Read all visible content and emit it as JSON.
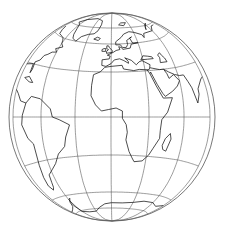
{
  "map": {
    "title": "Globe",
    "projection": "globular / orthographic-style hemisphere",
    "center": {
      "lon": 0,
      "lat": 0
    },
    "colors": {
      "background": "#ffffff",
      "graticule": "#5a5a5a",
      "coastline": "#111111",
      "rim": "#555555"
    },
    "canvas": {
      "width": 225,
      "height": 234
    },
    "globe": {
      "cx": 112,
      "cy": 117,
      "rx": 103,
      "ry": 104
    },
    "graticule": {
      "meridians": [
        -90,
        -60,
        -30,
        0,
        30,
        60,
        90
      ],
      "parallels": [
        -75,
        -60,
        -30,
        0,
        30,
        60,
        75
      ]
    },
    "parallel_center_y": {
      "-90": 221,
      "-75": 208,
      "-60": 192,
      "-30": 155,
      "0": 117,
      "30": 72,
      "60": 44,
      "75": 28,
      "90": 13
    },
    "parallel_edge_y": {
      "-90": 221,
      "-75": 214,
      "-60": 200,
      "-30": 166,
      "0": 117,
      "30": 62,
      "60": 32,
      "75": 22,
      "90": 13
    },
    "meridian_equator_x": {
      "-90": 13,
      "-60": 41,
      "-30": 75,
      "0": 111,
      "30": 149,
      "60": 184,
      "90": 210
    },
    "coastlines": [
      {
        "name": "Africa",
        "points": [
          [
            -17,
            21
          ],
          [
            -16,
            28
          ],
          [
            -10,
            30
          ],
          [
            -6,
            35
          ],
          [
            0,
            36
          ],
          [
            10,
            37
          ],
          [
            11,
            33
          ],
          [
            20,
            31
          ],
          [
            25,
            32
          ],
          [
            32,
            31
          ],
          [
            34,
            28
          ],
          [
            38,
            20
          ],
          [
            43,
            12
          ],
          [
            51,
            12
          ],
          [
            46,
            3
          ],
          [
            41,
            -2
          ],
          [
            40,
            -10
          ],
          [
            40,
            -16
          ],
          [
            35,
            -24
          ],
          [
            32,
            -29
          ],
          [
            27,
            -34
          ],
          [
            20,
            -35
          ],
          [
            18,
            -32
          ],
          [
            15,
            -27
          ],
          [
            12,
            -18
          ],
          [
            13,
            -12
          ],
          [
            12,
            -6
          ],
          [
            9,
            -1
          ],
          [
            9,
            4
          ],
          [
            4,
            6
          ],
          [
            -2,
            5
          ],
          [
            -8,
            4
          ],
          [
            -13,
            8
          ],
          [
            -17,
            14
          ],
          [
            -17,
            21
          ]
        ]
      },
      {
        "name": "Madagascar",
        "points": [
          [
            44,
            -24
          ],
          [
            47,
            -25
          ],
          [
            50,
            -16
          ],
          [
            49,
            -12
          ],
          [
            45,
            -16
          ],
          [
            43,
            -21
          ],
          [
            44,
            -24
          ]
        ]
      },
      {
        "name": "South America",
        "points": [
          [
            -77,
            8
          ],
          [
            -72,
            12
          ],
          [
            -62,
            11
          ],
          [
            -52,
            5
          ],
          [
            -50,
            0
          ],
          [
            -44,
            -2
          ],
          [
            -35,
            -6
          ],
          [
            -39,
            -15
          ],
          [
            -41,
            -22
          ],
          [
            -48,
            -27
          ],
          [
            -53,
            -34
          ],
          [
            -58,
            -38
          ],
          [
            -65,
            -42
          ],
          [
            -67,
            -48
          ],
          [
            -69,
            -52
          ],
          [
            -72,
            -54
          ],
          [
            -75,
            -50
          ],
          [
            -74,
            -43
          ],
          [
            -72,
            -33
          ],
          [
            -71,
            -18
          ],
          [
            -76,
            -14
          ],
          [
            -81,
            -5
          ],
          [
            -80,
            1
          ],
          [
            -77,
            8
          ]
        ]
      },
      {
        "name": "Central America",
        "points": [
          [
            -77,
            8
          ],
          [
            -83,
            9
          ],
          [
            -87,
            13
          ],
          [
            -92,
            15
          ],
          [
            -95,
            18
          ],
          [
            -97,
            22
          ],
          [
            -97,
            27
          ]
        ]
      },
      {
        "name": "Caribbean",
        "points": [
          [
            -85,
            22
          ],
          [
            -80,
            23
          ],
          [
            -74,
            20
          ],
          [
            -78,
            20
          ],
          [
            -85,
            22
          ]
        ]
      },
      {
        "name": "North America east",
        "points": [
          [
            -97,
            27
          ],
          [
            -90,
            29
          ],
          [
            -82,
            30
          ],
          [
            -81,
            25
          ],
          [
            -80,
            27
          ],
          [
            -81,
            32
          ],
          [
            -76,
            35
          ],
          [
            -74,
            40
          ],
          [
            -70,
            42
          ],
          [
            -66,
            45
          ],
          [
            -60,
            46
          ],
          [
            -64,
            49
          ],
          [
            -56,
            52
          ],
          [
            -60,
            55
          ],
          [
            -62,
            58
          ],
          [
            -65,
            60
          ],
          [
            -70,
            61
          ],
          [
            -78,
            62
          ],
          [
            -82,
            66
          ],
          [
            -86,
            70
          ]
        ]
      },
      {
        "name": "Greenland",
        "points": [
          [
            -44,
            60
          ],
          [
            -50,
            62
          ],
          [
            -53,
            66
          ],
          [
            -56,
            72
          ],
          [
            -60,
            76
          ],
          [
            -70,
            78
          ],
          [
            -60,
            82
          ],
          [
            -35,
            84
          ],
          [
            -20,
            82
          ],
          [
            -18,
            78
          ],
          [
            -20,
            72
          ],
          [
            -24,
            69
          ],
          [
            -32,
            68
          ],
          [
            -40,
            65
          ],
          [
            -44,
            60
          ]
        ]
      },
      {
        "name": "Iceland",
        "points": [
          [
            -22,
            64
          ],
          [
            -18,
            66
          ],
          [
            -14,
            65
          ],
          [
            -16,
            63
          ],
          [
            -22,
            64
          ]
        ]
      },
      {
        "name": "Great Britain",
        "points": [
          [
            -5,
            50
          ],
          [
            1,
            51
          ],
          [
            1,
            53
          ],
          [
            -2,
            56
          ],
          [
            -3,
            58
          ],
          [
            -5,
            58
          ],
          [
            -5,
            55
          ],
          [
            -3,
            54
          ],
          [
            -5,
            52
          ],
          [
            -5,
            50
          ]
        ]
      },
      {
        "name": "Ireland",
        "points": [
          [
            -10,
            52
          ],
          [
            -6,
            52
          ],
          [
            -6,
            55
          ],
          [
            -8,
            55
          ],
          [
            -10,
            54
          ],
          [
            -10,
            52
          ]
        ]
      },
      {
        "name": "Europe",
        "points": [
          [
            -9,
            43
          ],
          [
            -9,
            37
          ],
          [
            -5,
            36
          ],
          [
            0,
            39
          ],
          [
            3,
            43
          ],
          [
            8,
            44
          ],
          [
            12,
            42
          ],
          [
            16,
            39
          ],
          [
            16,
            41
          ],
          [
            13,
            45
          ],
          [
            19,
            42
          ],
          [
            23,
            37
          ],
          [
            26,
            40
          ],
          [
            29,
            41
          ],
          [
            36,
            36
          ],
          [
            35,
            33
          ],
          [
            34,
            31
          ],
          [
            32,
            31
          ]
        ]
      },
      {
        "name": "Europe north",
        "points": [
          [
            -9,
            43
          ],
          [
            -2,
            44
          ],
          [
            -1,
            47
          ],
          [
            -4,
            48
          ],
          [
            2,
            51
          ],
          [
            5,
            53
          ],
          [
            9,
            54
          ],
          [
            8,
            57
          ],
          [
            11,
            56
          ],
          [
            12,
            54
          ],
          [
            20,
            55
          ],
          [
            22,
            59
          ],
          [
            30,
            60
          ],
          [
            24,
            60
          ],
          [
            22,
            65
          ],
          [
            25,
            66
          ],
          [
            18,
            63
          ],
          [
            18,
            59
          ],
          [
            16,
            56
          ],
          [
            12,
            56
          ],
          [
            10,
            59
          ],
          [
            5,
            59
          ],
          [
            5,
            62
          ],
          [
            12,
            66
          ],
          [
            16,
            69
          ],
          [
            24,
            71
          ],
          [
            31,
            70
          ],
          [
            40,
            67
          ],
          [
            41,
            64
          ],
          [
            44,
            68
          ],
          [
            60,
            69
          ],
          [
            70,
            73
          ],
          [
            80,
            73
          ],
          [
            100,
            77
          ]
        ]
      },
      {
        "name": "Black Sea",
        "points": [
          [
            28,
            42
          ],
          [
            31,
            46
          ],
          [
            36,
            45
          ],
          [
            40,
            44
          ],
          [
            41,
            42
          ],
          [
            35,
            42
          ],
          [
            28,
            42
          ]
        ]
      },
      {
        "name": "Caspian Sea",
        "points": [
          [
            47,
            37
          ],
          [
            54,
            37
          ],
          [
            53,
            41
          ],
          [
            51,
            44
          ],
          [
            50,
            47
          ],
          [
            47,
            45
          ],
          [
            48,
            42
          ],
          [
            47,
            37
          ]
        ]
      },
      {
        "name": "Arabia",
        "points": [
          [
            34,
            28
          ],
          [
            35,
            29
          ],
          [
            39,
            21
          ],
          [
            43,
            15
          ],
          [
            45,
            13
          ],
          [
            52,
            16
          ],
          [
            57,
            19
          ],
          [
            60,
            22
          ],
          [
            56,
            26
          ],
          [
            51,
            24
          ],
          [
            50,
            27
          ],
          [
            48,
            30
          ],
          [
            44,
            30
          ],
          [
            38,
            32
          ],
          [
            35,
            33
          ]
        ]
      },
      {
        "name": "Persian/India",
        "points": [
          [
            48,
            30
          ],
          [
            52,
            28
          ],
          [
            57,
            26
          ],
          [
            62,
            25
          ],
          [
            67,
            25
          ],
          [
            70,
            21
          ],
          [
            73,
            17
          ],
          [
            77,
            8
          ],
          [
            80,
            13
          ],
          [
            80,
            16
          ],
          [
            87,
            21
          ],
          [
            91,
            22
          ]
        ]
      },
      {
        "name": "Svalbard",
        "points": [
          [
            12,
            78
          ],
          [
            17,
            80
          ],
          [
            26,
            80
          ],
          [
            20,
            77
          ],
          [
            12,
            78
          ]
        ]
      },
      {
        "name": "Novaya Zemlya",
        "points": [
          [
            52,
            71
          ],
          [
            56,
            74
          ],
          [
            66,
            77
          ],
          [
            60,
            76
          ],
          [
            54,
            73
          ],
          [
            52,
            71
          ]
        ]
      },
      {
        "name": "Antarctica",
        "points": [
          [
            -60,
            -64
          ],
          [
            -57,
            -63
          ],
          [
            -62,
            -66
          ],
          [
            -66,
            -70
          ],
          [
            -75,
            -72
          ],
          [
            -90,
            -73
          ],
          [
            -100,
            -74
          ]
        ]
      },
      {
        "name": "Antarctica east",
        "points": [
          [
            -30,
            -78
          ],
          [
            -20,
            -74
          ],
          [
            -10,
            -71
          ],
          [
            0,
            -70
          ],
          [
            15,
            -70
          ],
          [
            30,
            -69
          ],
          [
            45,
            -67
          ],
          [
            60,
            -67
          ],
          [
            75,
            -69
          ],
          [
            90,
            -66
          ]
        ]
      },
      {
        "name": "Weddell",
        "points": [
          [
            -60,
            -64
          ],
          [
            -62,
            -70
          ],
          [
            -60,
            -76
          ],
          [
            -45,
            -78
          ],
          [
            -30,
            -78
          ]
        ]
      }
    ]
  }
}
